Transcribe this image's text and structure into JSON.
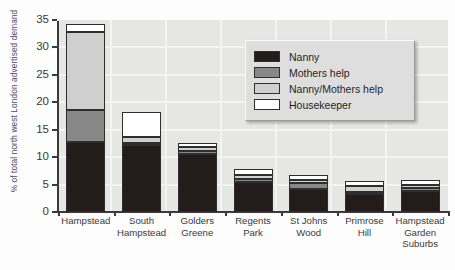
{
  "chart_data": {
    "type": "bar",
    "subtype": "stacked-bar",
    "title": "",
    "xlabel": "",
    "ylabel": "% of total north west London advertised demand",
    "ylim": [
      0,
      35
    ],
    "yticks": [
      "0",
      "5",
      "10",
      "15",
      "20",
      "25",
      "30",
      "35"
    ],
    "grid": true,
    "legend_position": "inside-top-right",
    "categories": [
      "Hampstead",
      "South Hampstead",
      "Golders Greene",
      "Regents Park",
      "St Johns Wood",
      "Primrose Hill",
      "Hampstead Garden Suburbs"
    ],
    "category_lines": [
      [
        "Hampstead"
      ],
      [
        "South",
        "Hampstead"
      ],
      [
        "Golders",
        "Greene"
      ],
      [
        "Regents",
        "Park"
      ],
      [
        "St Johns",
        "Wood"
      ],
      [
        "Primrose",
        "Hill"
      ],
      [
        "Hampstead",
        "Garden",
        "Suburbs"
      ]
    ],
    "series": [
      {
        "name": "Nanny",
        "color": "#231c1a",
        "values": [
          12.8,
          12.3,
          10.6,
          5.5,
          4.2,
          3.2,
          3.9
        ]
      },
      {
        "name": "Mothers help",
        "color": "#888888",
        "values": [
          5.8,
          0.3,
          0.5,
          0.6,
          1.1,
          0.4,
          0.5
        ]
      },
      {
        "name": "Nanny/Mothers help",
        "color": "#cfcfcf",
        "values": [
          14.2,
          1.0,
          0.7,
          0.7,
          0.5,
          1.1,
          0.6
        ]
      },
      {
        "name": "Housekeeper",
        "color": "#ffffff",
        "values": [
          1.4,
          4.6,
          0.7,
          1.0,
          1.0,
          1.0,
          0.8
        ]
      }
    ],
    "totals": [
      34.2,
      18.2,
      12.5,
      7.8,
      6.8,
      5.7,
      5.8
    ]
  },
  "legend": {
    "items": [
      {
        "label": "Nanny",
        "swatch": "nanny"
      },
      {
        "label": "Mothers help",
        "swatch": "mhelp"
      },
      {
        "label": "Nanny/Mothers help",
        "swatch": "nmhelp"
      },
      {
        "label": "Housekeeper",
        "swatch": "hkeep"
      }
    ]
  }
}
